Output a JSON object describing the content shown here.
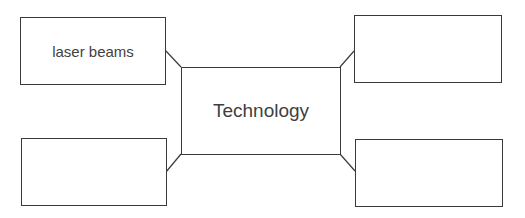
{
  "diagram": {
    "type": "mind-map",
    "center": {
      "label": "Technology"
    },
    "branches": [
      {
        "position": "top-left",
        "label": "laser beams"
      },
      {
        "position": "bottom-left",
        "label": ""
      },
      {
        "position": "top-right",
        "label": ""
      },
      {
        "position": "bottom-right",
        "label": ""
      }
    ]
  }
}
